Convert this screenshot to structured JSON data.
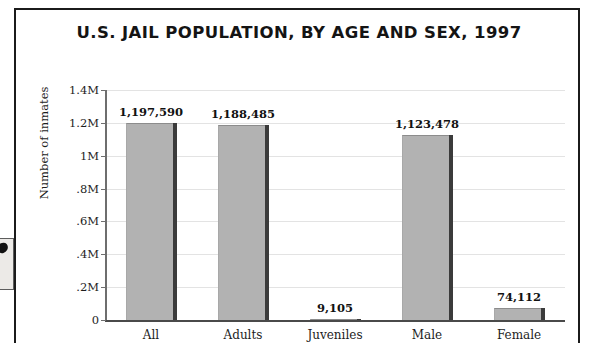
{
  "chart_data": {
    "type": "bar",
    "title": "U.S. JAIL POPULATION, BY AGE AND SEX, 1997",
    "xlabel": "",
    "ylabel": "Number of inmates",
    "categories": [
      "All",
      "Adults",
      "Juveniles",
      "Male",
      "Female"
    ],
    "values": [
      1197590,
      1188485,
      9105,
      1123478,
      74112
    ],
    "value_labels": [
      "1,197,590",
      "1,188,485",
      "9,105",
      "1,123,478",
      "74,112"
    ],
    "ylim": [
      0,
      1400000
    ],
    "yticks": [
      0,
      200000,
      400000,
      600000,
      800000,
      1000000,
      1200000,
      1400000
    ],
    "ytick_labels": [
      "0",
      ".2M",
      ".4M",
      ".6M",
      ".8M",
      "1M",
      "1.2M",
      "1.4M"
    ],
    "grid": true,
    "legend": "none",
    "bar_color": "#b2b2b2",
    "bar_shadow_color": "#3b3b3b",
    "gridline_color": "#e3e3e3",
    "axis_color": "#4a4a4a",
    "text_color": "#1d1d1d"
  },
  "artifact": {
    "name": "scan-edge-artifact"
  }
}
